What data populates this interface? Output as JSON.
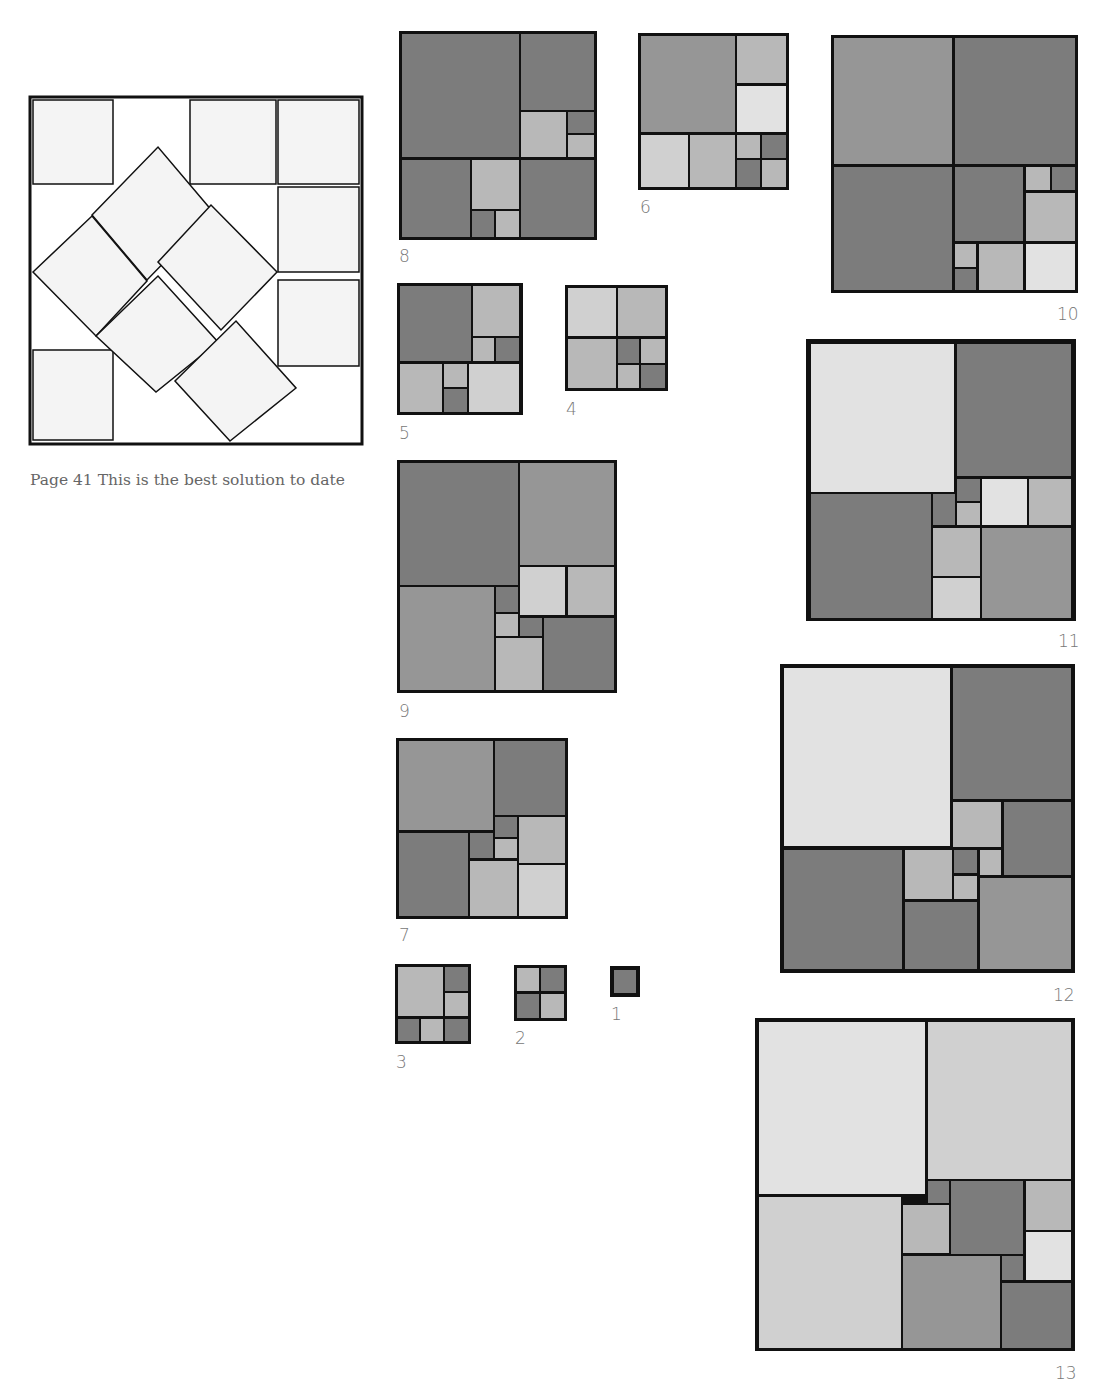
{
  "caption": "Page 41 This is the best solution to date",
  "colors": {
    "border": "#111111",
    "dark": "#7c7c7c",
    "mid": "#969696",
    "light": "#b8b8b8",
    "pale": "#d0d0d0",
    "paler": "#e2e2e2",
    "main_fill": "#f4f4f4"
  },
  "main_figure": {
    "x": 30,
    "y": 97,
    "w": 332,
    "h": 347,
    "axis_squares": [
      [
        33,
        100,
        113,
        184
      ],
      [
        190,
        100,
        276,
        184
      ],
      [
        278,
        100,
        359,
        184
      ],
      [
        278,
        187,
        359,
        272
      ],
      [
        278,
        280,
        359,
        366
      ],
      [
        33,
        350,
        113,
        440
      ]
    ],
    "rotated_squares": [
      [
        [
          92,
          215
        ],
        [
          158,
          147
        ],
        [
          213,
          212
        ],
        [
          147,
          280
        ]
      ],
      [
        [
          33,
          272
        ],
        [
          92,
          216
        ],
        [
          147,
          281
        ],
        [
          96,
          336
        ]
      ],
      [
        [
          158,
          262
        ],
        [
          211,
          205
        ],
        [
          277,
          272
        ],
        [
          221,
          330
        ]
      ],
      [
        [
          96,
          336
        ],
        [
          158,
          276
        ],
        [
          218,
          342
        ],
        [
          156,
          392
        ]
      ],
      [
        [
          175,
          381
        ],
        [
          236,
          321
        ],
        [
          296,
          388
        ],
        [
          230,
          441
        ]
      ]
    ]
  },
  "figures": [
    {
      "number": "8",
      "x": 399,
      "y": 31,
      "w": 198,
      "h": 209,
      "label_x": 399,
      "label_y": 248,
      "tiles": [
        [
          3,
          3,
          120,
          126,
          "dark"
        ],
        [
          122,
          3,
          195,
          79,
          "dark"
        ],
        [
          122,
          81,
          167,
          126,
          "light"
        ],
        [
          169,
          81,
          195,
          102,
          "dark"
        ],
        [
          169,
          104,
          195,
          126,
          "light"
        ],
        [
          3,
          129,
          71,
          206,
          "dark"
        ],
        [
          73,
          129,
          120,
          178,
          "light"
        ],
        [
          73,
          180,
          95,
          206,
          "dark"
        ],
        [
          97,
          180,
          120,
          206,
          "light"
        ],
        [
          122,
          129,
          195,
          206,
          "dark"
        ]
      ]
    },
    {
      "number": "6",
      "x": 638,
      "y": 33,
      "w": 151,
      "h": 157,
      "label_x": 640,
      "label_y": 199,
      "tiles": [
        [
          3,
          3,
          97,
          99,
          "mid"
        ],
        [
          99,
          3,
          148,
          50,
          "light"
        ],
        [
          99,
          53,
          148,
          99,
          "paler"
        ],
        [
          3,
          102,
          50,
          154,
          "pale"
        ],
        [
          52,
          102,
          97,
          154,
          "light"
        ],
        [
          99,
          102,
          122,
          125,
          "light"
        ],
        [
          124,
          102,
          148,
          125,
          "dark"
        ],
        [
          99,
          127,
          122,
          154,
          "dark"
        ],
        [
          124,
          127,
          148,
          154,
          "light"
        ]
      ]
    },
    {
      "number": "10",
      "x": 831,
      "y": 35,
      "w": 247,
      "h": 258,
      "label_x": 1057,
      "label_y": 306,
      "tiles": [
        [
          3,
          3,
          121,
          129,
          "mid"
        ],
        [
          124,
          3,
          244,
          129,
          "dark"
        ],
        [
          3,
          132,
          121,
          255,
          "dark"
        ],
        [
          124,
          132,
          192,
          206,
          "dark"
        ],
        [
          195,
          132,
          219,
          155,
          "light"
        ],
        [
          221,
          132,
          244,
          155,
          "dark"
        ],
        [
          195,
          158,
          244,
          206,
          "light"
        ],
        [
          124,
          209,
          145,
          232,
          "light"
        ],
        [
          124,
          234,
          145,
          255,
          "dark"
        ],
        [
          148,
          209,
          192,
          255,
          "light"
        ],
        [
          195,
          209,
          244,
          255,
          "paler"
        ]
      ]
    },
    {
      "number": "5",
      "x": 397,
      "y": 283,
      "w": 126,
      "h": 132,
      "label_x": 399,
      "label_y": 425,
      "tiles": [
        [
          3,
          3,
          74,
          78,
          "dark"
        ],
        [
          76,
          3,
          122,
          53,
          "light"
        ],
        [
          76,
          55,
          97,
          78,
          "light"
        ],
        [
          99,
          55,
          122,
          78,
          "dark"
        ],
        [
          3,
          81,
          45,
          129,
          "light"
        ],
        [
          47,
          81,
          70,
          104,
          "light"
        ],
        [
          47,
          106,
          70,
          129,
          "dark"
        ],
        [
          72,
          81,
          122,
          129,
          "pale"
        ]
      ]
    },
    {
      "number": "4",
      "x": 565,
      "y": 285,
      "w": 103,
      "h": 106,
      "label_x": 566,
      "label_y": 401,
      "tiles": [
        [
          3,
          3,
          51,
          51,
          "pale"
        ],
        [
          53,
          3,
          100,
          51,
          "light"
        ],
        [
          3,
          54,
          51,
          103,
          "light"
        ],
        [
          53,
          54,
          74,
          78,
          "dark"
        ],
        [
          76,
          54,
          100,
          78,
          "light"
        ],
        [
          53,
          80,
          74,
          103,
          "light"
        ],
        [
          76,
          80,
          100,
          103,
          "dark"
        ]
      ]
    },
    {
      "number": "9",
      "x": 397,
      "y": 460,
      "w": 220,
      "h": 233,
      "label_x": 399,
      "label_y": 703,
      "tiles": [
        [
          3,
          3,
          121,
          125,
          "dark"
        ],
        [
          123,
          3,
          217,
          105,
          "mid"
        ],
        [
          123,
          107,
          168,
          155,
          "pale"
        ],
        [
          171,
          107,
          217,
          155,
          "light"
        ],
        [
          3,
          127,
          97,
          230,
          "mid"
        ],
        [
          99,
          127,
          121,
          152,
          "dark"
        ],
        [
          99,
          154,
          121,
          176,
          "light"
        ],
        [
          123,
          158,
          145,
          176,
          "dark"
        ],
        [
          99,
          178,
          145,
          230,
          "light"
        ],
        [
          147,
          158,
          217,
          230,
          "dark"
        ]
      ]
    },
    {
      "number": "7",
      "x": 396,
      "y": 738,
      "w": 172,
      "h": 181,
      "label_x": 399,
      "label_y": 927,
      "tiles": [
        [
          3,
          3,
          97,
          92,
          "mid"
        ],
        [
          99,
          3,
          169,
          77,
          "dark"
        ],
        [
          99,
          79,
          121,
          99,
          "dark"
        ],
        [
          123,
          79,
          169,
          125,
          "light"
        ],
        [
          3,
          95,
          72,
          178,
          "dark"
        ],
        [
          74,
          95,
          97,
          120,
          "dark"
        ],
        [
          99,
          101,
          121,
          120,
          "light"
        ],
        [
          74,
          123,
          121,
          178,
          "light"
        ],
        [
          123,
          127,
          169,
          178,
          "pale"
        ]
      ]
    },
    {
      "number": "3",
      "x": 395,
      "y": 964,
      "w": 76,
      "h": 80,
      "label_x": 396,
      "label_y": 1054,
      "tiles": [
        [
          3,
          3,
          48,
          52,
          "light"
        ],
        [
          50,
          3,
          73,
          27,
          "dark"
        ],
        [
          50,
          29,
          73,
          52,
          "light"
        ],
        [
          3,
          55,
          24,
          77,
          "dark"
        ],
        [
          26,
          55,
          48,
          77,
          "light"
        ],
        [
          50,
          55,
          73,
          77,
          "dark"
        ]
      ]
    },
    {
      "number": "2",
      "x": 514,
      "y": 965,
      "w": 53,
      "h": 56,
      "label_x": 515,
      "label_y": 1030,
      "tiles": [
        [
          3,
          3,
          25,
          26,
          "light"
        ],
        [
          27,
          3,
          50,
          26,
          "dark"
        ],
        [
          3,
          29,
          25,
          53,
          "dark"
        ],
        [
          27,
          29,
          50,
          53,
          "light"
        ]
      ]
    },
    {
      "number": "1",
      "x": 610,
      "y": 966,
      "w": 30,
      "h": 31,
      "label_x": 611,
      "label_y": 1006,
      "tiles": [
        [
          4,
          4,
          26,
          27,
          "dark"
        ]
      ]
    },
    {
      "number": "11",
      "x": 806,
      "y": 339,
      "w": 270,
      "h": 282,
      "label_x": 1058,
      "label_y": 633,
      "tiles": [
        [
          5,
          5,
          148,
          153,
          "paler"
        ],
        [
          151,
          5,
          265,
          137,
          "dark"
        ],
        [
          151,
          140,
          174,
          162,
          "dark"
        ],
        [
          176,
          140,
          221,
          186,
          "paler"
        ],
        [
          223,
          140,
          265,
          186,
          "light"
        ],
        [
          5,
          155,
          125,
          279,
          "dark"
        ],
        [
          127,
          155,
          149,
          186,
          "dark"
        ],
        [
          151,
          164,
          174,
          186,
          "light"
        ],
        [
          127,
          189,
          174,
          237,
          "light"
        ],
        [
          127,
          239,
          174,
          279,
          "pale"
        ],
        [
          176,
          189,
          265,
          279,
          "mid"
        ]
      ]
    },
    {
      "number": "12",
      "x": 780,
      "y": 664,
      "w": 295,
      "h": 309,
      "label_x": 1053,
      "label_y": 987,
      "tiles": [
        [
          4,
          4,
          170,
          182,
          "paler"
        ],
        [
          173,
          4,
          291,
          135,
          "dark"
        ],
        [
          173,
          138,
          221,
          183,
          "light"
        ],
        [
          224,
          138,
          291,
          211,
          "dark"
        ],
        [
          4,
          186,
          122,
          305,
          "dark"
        ],
        [
          125,
          186,
          172,
          235,
          "light"
        ],
        [
          174,
          186,
          197,
          209,
          "dark"
        ],
        [
          200,
          186,
          221,
          211,
          "light"
        ],
        [
          174,
          212,
          197,
          235,
          "light"
        ],
        [
          200,
          214,
          291,
          305,
          "mid"
        ],
        [
          125,
          238,
          197,
          305,
          "dark"
        ]
      ]
    },
    {
      "number": "13",
      "x": 755,
      "y": 1018,
      "w": 320,
      "h": 333,
      "label_x": 1055,
      "label_y": 1365,
      "tiles": [
        [
          4,
          4,
          170,
          176,
          "paler"
        ],
        [
          173,
          4,
          316,
          161,
          "pale"
        ],
        [
          4,
          179,
          146,
          330,
          "pale"
        ],
        [
          173,
          163,
          194,
          185,
          "dark"
        ],
        [
          148,
          187,
          194,
          235,
          "light"
        ],
        [
          196,
          163,
          268,
          236,
          "dark"
        ],
        [
          271,
          163,
          316,
          212,
          "light"
        ],
        [
          271,
          214,
          316,
          262,
          "paler"
        ],
        [
          148,
          238,
          245,
          330,
          "mid"
        ],
        [
          247,
          238,
          268,
          262,
          "dark"
        ],
        [
          247,
          265,
          316,
          330,
          "dark"
        ]
      ]
    }
  ]
}
